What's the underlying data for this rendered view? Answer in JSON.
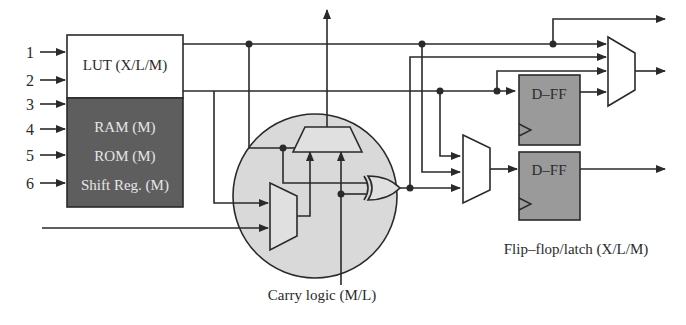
{
  "diagram": {
    "inputs": [
      "1",
      "2",
      "3",
      "4",
      "5",
      "6"
    ],
    "lut_label": "LUT (X/L/M)",
    "memory_labels": [
      "RAM (M)",
      "ROM (M)",
      "Shift Reg. (M)"
    ],
    "dff_top_label": "D–FF",
    "dff_bottom_label": "D–FF",
    "carry_logic_caption": "Carry logic (M/L)",
    "flipflop_caption": "Flip–flop/latch (X/L/M)",
    "colors": {
      "line": "#2a2a2a",
      "lut_fill": "#ffffff",
      "memory_fill": "#5e5e5e",
      "memory_text": "#e6e6e6",
      "carry_fill": "#d9d9d9",
      "dff_fill": "#9a9a9a",
      "gate_fill": "#e0e0e0"
    }
  }
}
